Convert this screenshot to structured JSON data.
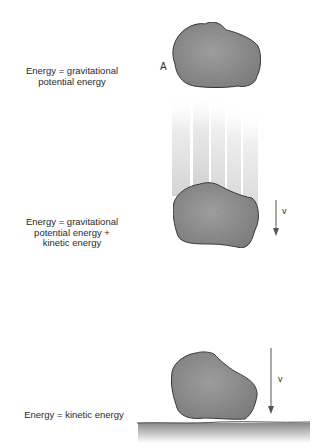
{
  "diagram": {
    "stages": [
      {
        "id": "top",
        "label_lines": [
          "Energy = gravitational",
          "potential energy"
        ],
        "point_label": "A"
      },
      {
        "id": "middle",
        "label_lines": [
          "Energy = gravitational",
          "potential energy +",
          "kinetic energy"
        ],
        "velocity_label": "v"
      },
      {
        "id": "bottom",
        "label_lines": [
          "Energy = kinetic energy"
        ],
        "velocity_label": "v"
      }
    ],
    "colors": {
      "rock_fill": "#8e8e8e",
      "rock_outline": "#3a3a3a",
      "streak": "#d6d6d6",
      "ground_shadow": "#9a9a9a",
      "arrow": "#555555"
    }
  }
}
